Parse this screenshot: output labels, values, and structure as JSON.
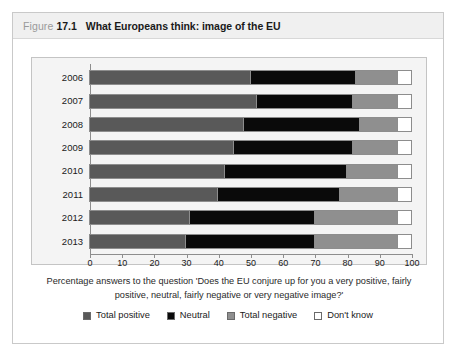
{
  "figure": {
    "prefix": "Figure",
    "number": "17.1",
    "title": "What Europeans think: image of the EU"
  },
  "caption": "Percentage answers to the question 'Does the EU conjure up for you a very positive, fairly positive, neutral, fairly negative or very negative image?'",
  "legend": [
    {
      "label": "Total positive",
      "color": "#595959"
    },
    {
      "label": "Neutral",
      "color": "#0a0a0a"
    },
    {
      "label": "Total negative",
      "color": "#8f8f8f"
    },
    {
      "label": "Don't know",
      "color": "#ffffff"
    }
  ],
  "axis": {
    "ticks": [
      "0",
      "10",
      "20",
      "30",
      "40",
      "50",
      "60",
      "70",
      "80",
      "90",
      "100"
    ]
  },
  "chart_data": {
    "type": "bar",
    "orientation": "horizontal",
    "stacked": true,
    "title": "What Europeans think: image of the EU",
    "xlabel": "",
    "ylabel": "",
    "xlim": [
      0,
      100
    ],
    "grid": false,
    "legend_position": "bottom",
    "categories": [
      "2006",
      "2007",
      "2008",
      "2009",
      "2010",
      "2011",
      "2012",
      "2013"
    ],
    "series": [
      {
        "name": "Total positive",
        "color": "#595959",
        "values": [
          50,
          52,
          48,
          45,
          42,
          40,
          31,
          30
        ]
      },
      {
        "name": "Neutral",
        "color": "#0a0a0a",
        "values": [
          33,
          30,
          36,
          37,
          38,
          38,
          39,
          40
        ]
      },
      {
        "name": "Total negative",
        "color": "#8f8f8f",
        "values": [
          13,
          14,
          12,
          14,
          16,
          18,
          26,
          26
        ]
      },
      {
        "name": "Don't know",
        "color": "#ffffff",
        "values": [
          4,
          4,
          4,
          4,
          4,
          4,
          4,
          4
        ]
      }
    ]
  }
}
